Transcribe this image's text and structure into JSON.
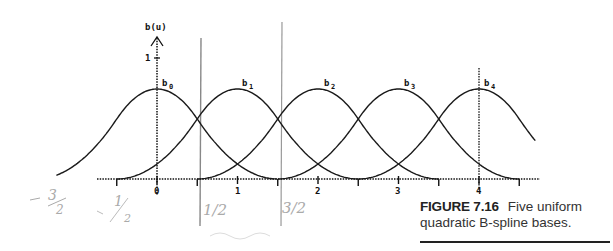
{
  "chart_data": {
    "type": "line",
    "title": "",
    "xlabel": "",
    "ylabel": "b(u)",
    "x_tick_labels": [
      "0",
      "1",
      "2",
      "3",
      "4"
    ],
    "x_ticks": [
      -0.5,
      0,
      0.5,
      1,
      1.5,
      2,
      2.5,
      3,
      3.5,
      4,
      4.5
    ],
    "y_tick_labels": [
      "1"
    ],
    "xlim": [
      -1.5,
      4.75
    ],
    "ylim": [
      0,
      1.2
    ],
    "grid": false,
    "series": [
      {
        "name": "b0",
        "center": 0,
        "peak": 0.75
      },
      {
        "name": "b1",
        "center": 1,
        "peak": 0.75
      },
      {
        "name": "b2",
        "center": 2,
        "peak": 0.75
      },
      {
        "name": "b3",
        "center": 3,
        "peak": 0.75
      },
      {
        "name": "b4",
        "center": 4,
        "peak": 0.75
      }
    ],
    "annotations": {
      "handwritten": [
        "-3/2",
        "-1/2",
        "1/2",
        "3/2"
      ],
      "pen_vertical_lines_at_x": [
        0.5,
        1.5
      ]
    }
  },
  "figure": {
    "axis_label": "b(u)",
    "y_tick": "1",
    "x_labels": [
      "0",
      "1",
      "2",
      "3",
      "4"
    ],
    "curve_labels": [
      "b",
      "b",
      "b",
      "b",
      "b"
    ],
    "curve_subs": [
      "0",
      "1",
      "2",
      "3",
      "4"
    ],
    "handwritten": [
      "-3",
      "2",
      "1",
      "2",
      "1/2",
      "3/2"
    ]
  },
  "caption": {
    "figure_number": "FIGURE 7.16",
    "text": "Five uniform quadratic B-spline bases."
  }
}
